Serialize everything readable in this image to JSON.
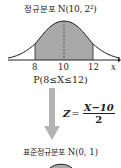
{
  "top": {
    "label_ko": "정규분포",
    "label_math": "N(10, 2²)"
  },
  "graph": {
    "ticks": [
      "8",
      "10",
      "12"
    ],
    "axis_label": "x",
    "shade_color": "#a9a9a9",
    "curve_color": "#222222"
  },
  "probability": "P(8≤X≤12)",
  "transform": {
    "lhs": "Z",
    "equals": "=",
    "numerator": "X−10",
    "denominator": "2"
  },
  "arrow_color": "#b3b3b3",
  "bottom": {
    "label_ko": "표준정규분포",
    "label_math": "N(0, 1)"
  }
}
